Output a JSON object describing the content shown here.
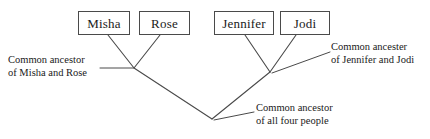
{
  "diagram": {
    "type": "cladogram",
    "line_color": "#4a4a4a",
    "box_border_color": "#4a4a4a",
    "background_color": "#ffffff",
    "text_color": "#1a1a1a"
  },
  "taxa": [
    {
      "id": "misha",
      "label": "Misha"
    },
    {
      "id": "rose",
      "label": "Rose"
    },
    {
      "id": "jennifer",
      "label": "Jennifer"
    },
    {
      "id": "jodi",
      "label": "Jodi"
    }
  ],
  "annotations": {
    "left": {
      "line1": "Common ancestor",
      "line2": "of Misha and Rose"
    },
    "right": {
      "line1": "Common ancester",
      "line2": "of Jennifer and Jodi"
    },
    "root": {
      "line1": "Common ancestor",
      "line2": "of all four people"
    }
  }
}
